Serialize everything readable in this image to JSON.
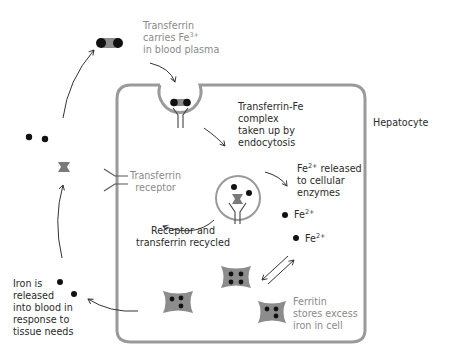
{
  "diagram": {
    "cell_label": "Hepatocyte",
    "labels": {
      "transferrin_carries": {
        "line1": "Transferrin",
        "line2_prefix": "carries Fe",
        "line2_sup": "3+",
        "line3": "in blood plasma"
      },
      "endocytosis": {
        "line1": "Transferrin-Fe",
        "line2": "complex",
        "line3": "taken up by",
        "line4": "endocytosis"
      },
      "fe_released": {
        "line1_prefix": "Fe",
        "line1_sup": "2+",
        "line1_suffix": " released",
        "line2": "to cellular",
        "line3": "enzymes"
      },
      "fe2_a": {
        "prefix": "Fe",
        "sup": "2+"
      },
      "fe2_b": {
        "prefix": "Fe",
        "sup": "2+"
      },
      "transferrin_receptor": {
        "line1": "Transferrin",
        "line2": "receptor"
      },
      "recycled": {
        "line1": "Receptor and",
        "line2": "transferrin recycled"
      },
      "iron_released": {
        "line1": "Iron is",
        "line2": "released",
        "line3": "into blood in",
        "line4": "response to",
        "line5": "tissue needs"
      },
      "ferritin": {
        "line1": "Ferritin",
        "line2": "stores excess",
        "line3": "iron in cell"
      }
    },
    "colors": {
      "membrane": "#9a9a9a",
      "protein_fill": "#8c8c8c",
      "iron": "#111111",
      "text_dark": "#2a2a2a",
      "text_grey": "#8a8a8a",
      "arrow": "#333333"
    }
  }
}
